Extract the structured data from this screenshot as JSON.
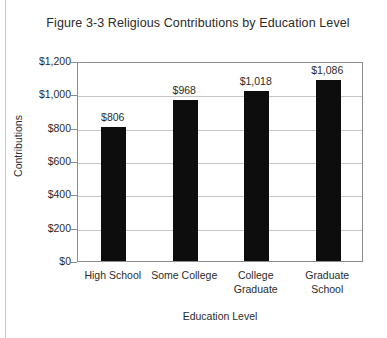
{
  "chart_data": {
    "type": "bar",
    "title": "Figure 3-3 Religious Contributions by Education Level",
    "xlabel": "Education Level",
    "ylabel": "Contributions",
    "categories": [
      "High School",
      "Some College",
      "College Graduate",
      "Graduate School"
    ],
    "category_lines": [
      [
        "High School"
      ],
      [
        "Some College"
      ],
      [
        "College",
        "Graduate"
      ],
      [
        "Graduate",
        "School"
      ]
    ],
    "values": [
      806,
      968,
      1018,
      1086
    ],
    "data_labels": [
      "$806",
      "$968",
      "$1,018",
      "$1,086"
    ],
    "ylim": [
      0,
      1200
    ],
    "ytick_values": [
      0,
      200,
      400,
      600,
      800,
      1000,
      1200
    ],
    "ytick_labels": [
      "$0",
      "$200",
      "$400",
      "$600",
      "$800",
      "$1,000",
      "$1,200"
    ],
    "grid": true,
    "legend": false,
    "bar_color": "#0d0d0d",
    "gridline_color": "#c6c6c6",
    "frame_color": "#8c8c8c",
    "background_color": "#ffffff"
  }
}
